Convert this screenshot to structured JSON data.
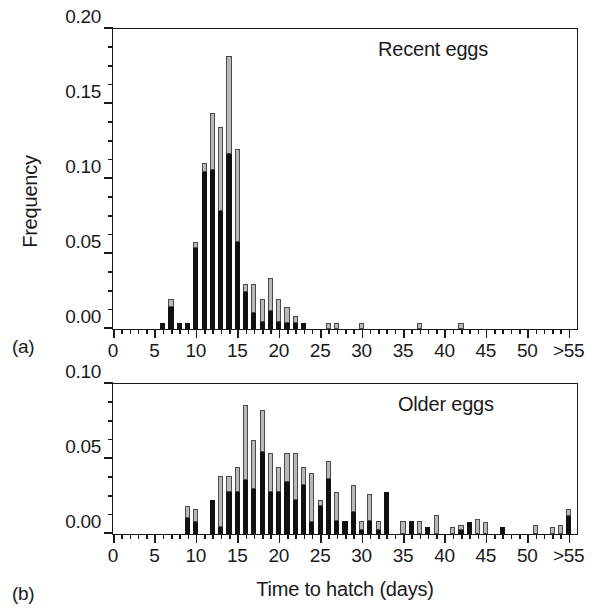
{
  "figure": {
    "axis_title_x": "Time to hatch (days)",
    "axis_title_y": "Frequency",
    "panel_tag_a": "(a)",
    "panel_tag_b": "(b)"
  },
  "panels": {
    "a": {
      "annotation": "Recent eggs",
      "y_ticks": [
        "0.00",
        "0.05",
        "0.10",
        "0.15",
        "0.20"
      ],
      "x_ticks": [
        "0",
        "5",
        "10",
        "15",
        "20",
        "25",
        "30",
        "35",
        "40",
        "45",
        "50",
        ">55"
      ]
    },
    "b": {
      "annotation": "Older eggs",
      "y_ticks": [
        "0.00",
        "0.05",
        "0.10"
      ],
      "x_ticks": [
        "0",
        "5",
        "10",
        "15",
        "20",
        "25",
        "30",
        "35",
        "40",
        "45",
        "50",
        ">55"
      ]
    }
  },
  "colors": {
    "black_segment": "#111111",
    "gray_segment": "#b9b9b9",
    "gray_segment_edge": "#4a4a4a",
    "axis": "#1a1a1a",
    "background": "#ffffff"
  },
  "chart_data": [
    {
      "type": "bar",
      "id": "panel-a",
      "title": "Recent eggs",
      "subtitle": "(a)",
      "xlabel": "",
      "ylabel": "Frequency",
      "xlim": [
        0,
        56
      ],
      "ylim": [
        0.0,
        0.2
      ],
      "ytick_values": [
        0.0,
        0.05,
        0.1,
        0.15,
        0.2
      ],
      "ytick_minor_step": 0.0125,
      "xtick_values": [
        0,
        5,
        10,
        15,
        20,
        25,
        30,
        35,
        40,
        45,
        50,
        55
      ],
      "xtick_labels": [
        "0",
        "5",
        "10",
        "15",
        "20",
        "25",
        "30",
        "35",
        "40",
        "45",
        "50",
        ">55"
      ],
      "bin_width": 1,
      "grid": false,
      "legend": "none",
      "stacked": true,
      "series": [
        {
          "name": "black",
          "color": "#111111",
          "x": [
            6,
            7,
            8,
            9,
            10,
            11,
            12,
            13,
            14,
            15,
            16,
            17,
            18,
            19,
            20,
            21,
            22,
            23,
            26,
            27,
            30,
            37,
            42
          ],
          "values": [
            0.004,
            0.015,
            0.004,
            0.004,
            0.054,
            0.105,
            0.106,
            0.079,
            0.117,
            0.058,
            0.025,
            0.011,
            0.005,
            0.012,
            0.005,
            0.004,
            0.004,
            0.004,
            0.0,
            0.0,
            0.0,
            0.0,
            0.0
          ]
        },
        {
          "name": "gray",
          "color": "#b9b9b9",
          "x": [
            6,
            7,
            8,
            9,
            10,
            11,
            12,
            13,
            14,
            15,
            16,
            17,
            18,
            19,
            20,
            21,
            22,
            23,
            26,
            27,
            30,
            37,
            42
          ],
          "values": [
            0.0,
            0.005,
            0.0,
            0.0,
            0.004,
            0.006,
            0.038,
            0.056,
            0.065,
            0.062,
            0.005,
            0.019,
            0.015,
            0.022,
            0.015,
            0.011,
            0.005,
            0.0,
            0.004,
            0.004,
            0.004,
            0.004,
            0.004
          ]
        }
      ],
      "totals": {
        "x": [
          6,
          7,
          8,
          9,
          10,
          11,
          12,
          13,
          14,
          15,
          16,
          17,
          18,
          19,
          20,
          21,
          22,
          23,
          26,
          27,
          30,
          37,
          42
        ],
        "values": [
          0.004,
          0.02,
          0.004,
          0.004,
          0.058,
          0.111,
          0.144,
          0.135,
          0.182,
          0.12,
          0.03,
          0.03,
          0.02,
          0.034,
          0.02,
          0.015,
          0.009,
          0.004,
          0.004,
          0.004,
          0.004,
          0.004,
          0.004
        ]
      }
    },
    {
      "type": "bar",
      "id": "panel-b",
      "title": "Older eggs",
      "subtitle": "(b)",
      "xlabel": "Time to hatch (days)",
      "ylabel": "Frequency",
      "xlim": [
        0,
        56
      ],
      "ylim": [
        0.0,
        0.1
      ],
      "ytick_values": [
        0.0,
        0.05,
        0.1
      ],
      "ytick_minor_step": 0.0125,
      "xtick_values": [
        0,
        5,
        10,
        15,
        20,
        25,
        30,
        35,
        40,
        45,
        50,
        55
      ],
      "xtick_labels": [
        "0",
        "5",
        "10",
        "15",
        "20",
        "25",
        "30",
        "35",
        "40",
        "45",
        "50",
        ">55"
      ],
      "bin_width": 1,
      "grid": false,
      "legend": "none",
      "stacked": true,
      "series": [
        {
          "name": "black",
          "color": "#111111",
          "x": [
            9,
            10,
            12,
            13,
            14,
            15,
            16,
            17,
            18,
            19,
            20,
            21,
            22,
            23,
            24,
            25,
            26,
            27,
            28,
            29,
            30,
            31,
            32,
            33,
            35,
            36,
            37,
            38,
            39,
            41,
            42,
            43,
            44,
            45,
            47,
            51,
            53,
            54,
            55
          ],
          "values": [
            0.011,
            0.008,
            0.023,
            0.005,
            0.028,
            0.028,
            0.036,
            0.03,
            0.055,
            0.028,
            0.028,
            0.035,
            0.023,
            0.033,
            0.008,
            0.019,
            0.037,
            0.009,
            0.009,
            0.015,
            0.003,
            0.009,
            0.003,
            0.028,
            0.0,
            0.009,
            0.0,
            0.005,
            0.0,
            0.0,
            0.003,
            0.008,
            0.0,
            0.0,
            0.005,
            0.0,
            0.0,
            0.0,
            0.012
          ]
        },
        {
          "name": "gray",
          "color": "#b9b9b9",
          "x": [
            9,
            10,
            12,
            13,
            14,
            15,
            16,
            17,
            18,
            19,
            20,
            21,
            22,
            23,
            24,
            25,
            26,
            27,
            28,
            29,
            30,
            31,
            32,
            33,
            35,
            36,
            37,
            38,
            39,
            41,
            42,
            43,
            44,
            45,
            47,
            51,
            53,
            54,
            55
          ],
          "values": [
            0.008,
            0.009,
            0.0,
            0.034,
            0.011,
            0.017,
            0.05,
            0.033,
            0.028,
            0.026,
            0.017,
            0.019,
            0.031,
            0.012,
            0.033,
            0.004,
            0.012,
            0.019,
            0.0,
            0.018,
            0.006,
            0.018,
            0.006,
            0.0,
            0.009,
            0.0,
            0.009,
            0.0,
            0.013,
            0.005,
            0.003,
            0.0,
            0.01,
            0.008,
            0.0,
            0.006,
            0.005,
            0.006,
            0.005
          ]
        }
      ],
      "totals": {
        "x": [
          9,
          10,
          12,
          13,
          14,
          15,
          16,
          17,
          18,
          19,
          20,
          21,
          22,
          23,
          24,
          25,
          26,
          27,
          28,
          29,
          30,
          31,
          32,
          33,
          35,
          36,
          37,
          38,
          39,
          41,
          42,
          43,
          44,
          45,
          47,
          51,
          53,
          54,
          55
        ],
        "values": [
          0.019,
          0.017,
          0.023,
          0.039,
          0.039,
          0.045,
          0.086,
          0.063,
          0.083,
          0.054,
          0.045,
          0.054,
          0.054,
          0.045,
          0.041,
          0.023,
          0.049,
          0.028,
          0.009,
          0.033,
          0.009,
          0.027,
          0.009,
          0.028,
          0.009,
          0.009,
          0.009,
          0.005,
          0.013,
          0.005,
          0.006,
          0.008,
          0.01,
          0.008,
          0.005,
          0.006,
          0.005,
          0.006,
          0.017
        ]
      }
    }
  ]
}
